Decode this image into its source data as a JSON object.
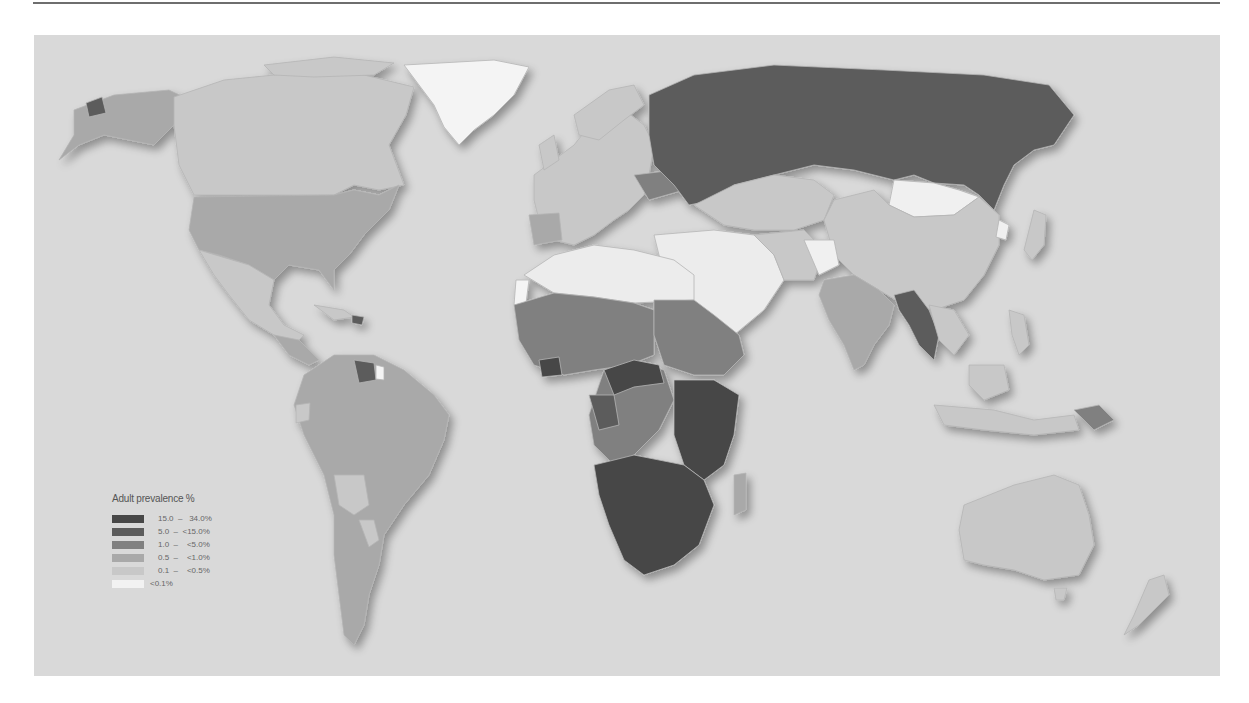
{
  "map": {
    "type": "choropleth",
    "projection": "world",
    "ocean_color": "#d9d9d9",
    "border_color": "#bdbdbd"
  },
  "legend": {
    "title": "Adult prevalence %",
    "classes": [
      {
        "label": "15.0  –   34.0%",
        "color": "#474747"
      },
      {
        "label": "5.0  –  <15.0%",
        "color": "#5c5c5c"
      },
      {
        "label": "1.0  –    <5.0%",
        "color": "#808080"
      },
      {
        "label": "0.5  –    <1.0%",
        "color": "#a9a9a9"
      },
      {
        "label": "0.1  –    <0.5%",
        "color": "#c8c8c8"
      },
      {
        "label": "<0.1%",
        "color": "#f2f2f2"
      }
    ]
  },
  "regions": {
    "russia": "5.0 - <15.0%",
    "usa": "0.5 - <1.0%",
    "canada": "0.1 - <0.5%",
    "greenland": "<0.1%",
    "mongolia": "<0.1%",
    "southern_africa": "15.0 - 34.0%",
    "east_africa": "5.0 - <15.0%",
    "central_west_africa": "1.0 - <5.0%",
    "north_africa": "<0.1%",
    "middle_east": "<0.1%",
    "india": "0.5 - <1.0%",
    "myanmar_thailand": "1.0 - <5.0%",
    "china": "0.1 - <0.5%",
    "brazil": "0.5 - <1.0%",
    "bolivia_paraguay": "0.1 - <0.5%",
    "guyana": "1.0 - <5.0%",
    "australia": "0.1 - <0.5%",
    "papua_new_guinea": "1.0 - <5.0%"
  }
}
